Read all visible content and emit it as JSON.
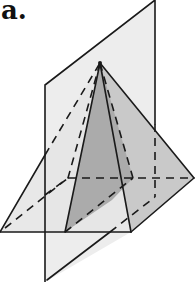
{
  "figure": {
    "label": "a.",
    "colors": {
      "plane_fill": "#ececec",
      "cross_section_fill": "#a8a8a8",
      "right_face_fill": "#c8c8c8",
      "front_face_fill": "#e2e2e2",
      "line": "#1a1a1a"
    }
  }
}
